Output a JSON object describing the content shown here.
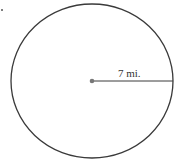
{
  "diagram": {
    "type": "circle",
    "radius_label": "7 mi.",
    "radius_value": 7,
    "radius_unit": "mi.",
    "colors": {
      "stroke": "#3a3a3a",
      "center_dot": "#777777",
      "background": "#ffffff"
    }
  }
}
